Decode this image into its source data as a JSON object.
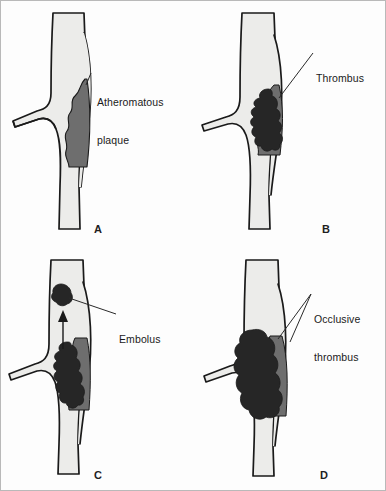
{
  "figure": {
    "background_color": "#fdfdfd",
    "border_color": "#b9b9b9"
  },
  "colors": {
    "vessel_lumen": "#ececea",
    "vessel_outline": "#1a1a1a",
    "plaque": "#6e6e6e",
    "thrombus": "#262626",
    "label_text": "#1a1a1a",
    "leader_line": "#2a2a2a"
  },
  "panels": [
    {
      "id": "a",
      "letter": "A",
      "label": "Atheromatous\nplaque",
      "label_lines": [
        "Atheromatous",
        "plaque"
      ],
      "features": [
        "vessel",
        "branch",
        "atheromatous-plaque"
      ]
    },
    {
      "id": "b",
      "letter": "B",
      "label": "Thrombus",
      "label_lines": [
        "Thrombus"
      ],
      "features": [
        "vessel",
        "branch",
        "atheromatous-plaque",
        "mural-thrombus"
      ]
    },
    {
      "id": "c",
      "letter": "C",
      "label": "Embolus",
      "label_lines": [
        "Embolus"
      ],
      "features": [
        "vessel",
        "branch",
        "atheromatous-plaque",
        "mural-thrombus",
        "embolus",
        "flow-arrow"
      ]
    },
    {
      "id": "d",
      "letter": "D",
      "label": "Occlusive\nthrombus",
      "label_lines": [
        "Occlusive",
        "thrombus"
      ],
      "features": [
        "vessel",
        "branch",
        "atheromatous-plaque",
        "occlusive-thrombus"
      ]
    }
  ]
}
